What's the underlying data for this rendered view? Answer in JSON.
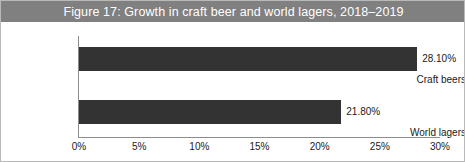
{
  "figure": {
    "title": "Figure 17: Growth in craft beer and world lagers, 2018–2019",
    "title_bar_color": "#808080",
    "title_text_color": "#ffffff",
    "bar_color": "#333333",
    "axis_color": "#8c8c8c",
    "border_color": "#b9b9b9",
    "background_color": "#ffffff"
  },
  "chart_data": {
    "type": "bar",
    "orientation": "horizontal",
    "title": "Figure 17: Growth in craft beer and world lagers, 2018–2019",
    "categories": [
      "Craft beers",
      "World lagers"
    ],
    "values": [
      28.1,
      21.8
    ],
    "value_labels": [
      "28.10%",
      "21.80%"
    ],
    "xlabel": "",
    "ylabel": "",
    "xlim": [
      0,
      30
    ],
    "ylim": null,
    "xticks": [
      0,
      5,
      10,
      15,
      20,
      25,
      30
    ],
    "xtick_labels": [
      "0%",
      "5%",
      "10%",
      "15%",
      "20%",
      "25%",
      "30%"
    ],
    "grid": false,
    "legend": false,
    "series": [
      {
        "name": "Growth",
        "values": [
          28.1,
          21.8
        ]
      }
    ]
  }
}
